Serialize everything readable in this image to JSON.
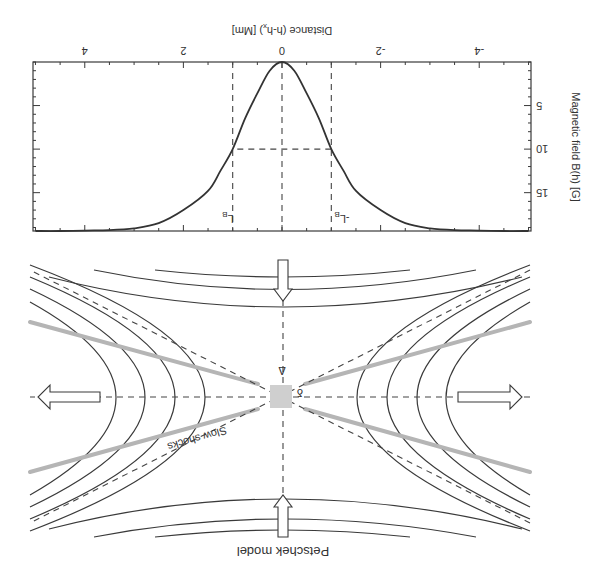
{
  "chart_data": {
    "type": "line",
    "title": "",
    "xlabel": "Distance (h-h_x) [Mm]",
    "ylabel": "Magnetic field B(h) [G]",
    "xlim": [
      -5.05,
      5.05
    ],
    "ylim": [
      0,
      19.4
    ],
    "x_ticks": [
      -4,
      -2,
      0,
      2,
      4
    ],
    "x_tick_labels": [
      "-4",
      "-2",
      "0",
      "2",
      "4"
    ],
    "y_ticks": [
      5,
      10,
      15
    ],
    "y_tick_labels": [
      "5",
      "10",
      "15"
    ],
    "grid": false,
    "series": [
      {
        "name": "B(h)",
        "x": [
          -5,
          -4.5,
          -4,
          -3.5,
          -3,
          -2.5,
          -2,
          -1.5,
          -1.25,
          -1,
          -0.75,
          -0.5,
          -0.25,
          0,
          0.25,
          0.5,
          0.75,
          1,
          1.25,
          1.5,
          2,
          2.5,
          3,
          3.5,
          4,
          4.5,
          5
        ],
        "y": [
          19.4,
          19.4,
          19.35,
          19.3,
          19.1,
          18.5,
          17.0,
          14.8,
          12.5,
          10.0,
          6.5,
          3.6,
          1.0,
          0,
          1.0,
          3.6,
          6.5,
          10.0,
          12.5,
          14.8,
          17.0,
          18.5,
          19.1,
          19.3,
          19.35,
          19.4,
          19.4
        ]
      }
    ],
    "reference_lines": {
      "vertical": [
        {
          "x": 0,
          "label": ""
        },
        {
          "x": -1,
          "label": "-L_B"
        },
        {
          "x": 1,
          "label": "L_B"
        }
      ],
      "horizontal": [
        {
          "y": 10,
          "x_from": -1,
          "x_to": 1
        }
      ]
    },
    "annotations": {
      "lb_pos": "L",
      "lb_neg": "-L",
      "lb_sub": "B"
    }
  },
  "diagram": {
    "title": "Petschek model",
    "shock_label": "Slow shocks",
    "delta_upper": "Δ",
    "delta_lower": "δ",
    "colors": {
      "shock": "#b5b5b5",
      "diffusion_region": "#cfcfcf",
      "lines": "#3a3a3a"
    }
  },
  "labels": {
    "x_axis": "Distance (h-h",
    "x_axis_sub": "x",
    "x_axis_tail": ") [Mm]",
    "y_axis": "Magnetic field B(h) [G]"
  }
}
